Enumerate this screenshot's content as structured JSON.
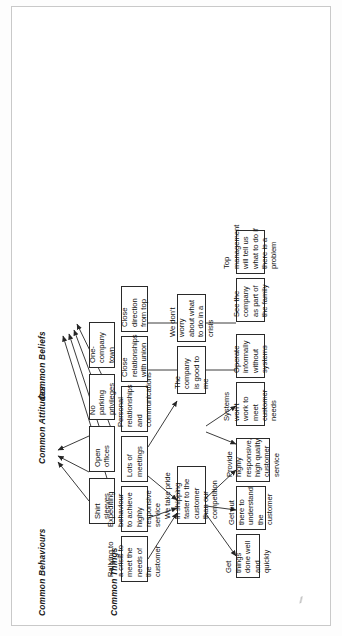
{
  "diagram": {
    "orientation": "rotated-90",
    "columns": [
      {
        "id": "things",
        "label": "Common Things"
      },
      {
        "id": "behaviours",
        "label": "Common Behaviours"
      },
      {
        "id": "attitudes",
        "label": "Common Attitudes"
      },
      {
        "id": "beliefs",
        "label": "Common Beliefs"
      }
    ],
    "nodes": {
      "things": [
        {
          "id": "t1",
          "label": "Shirt sleeves"
        },
        {
          "id": "t2",
          "label": "Open offices"
        },
        {
          "id": "t3",
          "label": "No parking privileges"
        },
        {
          "id": "t4",
          "label": "One-company town"
        }
      ],
      "behaviours": [
        {
          "id": "b1",
          "label": "Rallying to a crisis to meet the needs of the customer"
        },
        {
          "id": "b2",
          "label": "Expediting behaviour to achieve highly responsive service"
        },
        {
          "id": "b3",
          "label": "Lots of meetings"
        },
        {
          "id": "b4",
          "label": "Personal relationships and communications"
        },
        {
          "id": "b5",
          "label": "Close relationships with union"
        },
        {
          "id": "b6",
          "label": "Close direction from top"
        }
      ],
      "attitudes": [
        {
          "id": "a1",
          "label": "We take pride in shipping faster to the customer than our competition"
        },
        {
          "id": "a2",
          "label": "The company is good to me"
        },
        {
          "id": "a3",
          "label": "We don't worry about what to do in a crisis"
        }
      ],
      "beliefs": [
        {
          "id": "c1",
          "label": "Get things done well and quickly"
        },
        {
          "id": "c2",
          "label": "Get out there to understand the customer"
        },
        {
          "id": "c3",
          "label": "Provide highly responsive, high quality customer service"
        },
        {
          "id": "c4",
          "label": "Systems won't work to meet customer needs"
        },
        {
          "id": "c5",
          "label": "Operate informally without systems"
        },
        {
          "id": "c6",
          "label": "See the company as part of the family"
        },
        {
          "id": "c7",
          "label": "Top management will tell us what to do if there is a problem"
        }
      ]
    },
    "colors": {
      "node_border": "#2a2a2a",
      "node_fill": "#ffffff",
      "link": "#262626",
      "text": "#101010",
      "frame": "#c9c9c9"
    }
  }
}
